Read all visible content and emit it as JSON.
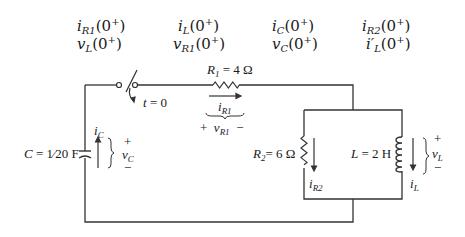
{
  "questions": [
    {
      "sym": "i",
      "sub": "R1",
      "arg": "(0",
      "sup": "+",
      "close": ")"
    },
    {
      "sym": "i",
      "sub": "L",
      "arg": "(0",
      "sup": "+",
      "close": ")"
    },
    {
      "sym": "i",
      "sub": "C",
      "arg": "(0",
      "sup": "+",
      "close": ")"
    },
    {
      "sym": "i",
      "sub": "R2",
      "arg": "(0",
      "sup": "+",
      "close": ")"
    },
    {
      "sym": "v",
      "sub": "L",
      "arg": "(0",
      "sup": "+",
      "close": ")"
    },
    {
      "sym": "v",
      "sub": "R1",
      "arg": "(0",
      "sup": "+",
      "close": ")"
    },
    {
      "sym": "v",
      "sub": "C",
      "arg": "(0",
      "sup": "+",
      "close": ")"
    },
    {
      "sym": "i′",
      "sub": "L",
      "arg": "(0",
      "sup": "+",
      "close": ")"
    }
  ],
  "components": {
    "r1": {
      "name": "R",
      "sub": "1",
      "value": " = 4 Ω"
    },
    "r2": {
      "name": "R",
      "sub": "2",
      "value": "= 6 Ω"
    },
    "l": {
      "name": "L",
      "value": " = 2 H"
    },
    "c": {
      "name": "C",
      "value": " = 1⁄20 F"
    },
    "switch": {
      "label": "t = 0"
    }
  },
  "annotations": {
    "iR1": {
      "sym": "i",
      "sub": "R1"
    },
    "vR1": {
      "plus": "+",
      "sym": "v",
      "sub": "R1",
      "minus": "−"
    },
    "iC": {
      "sym": "i",
      "sub": "C"
    },
    "vC": {
      "plus": "+",
      "sym": "v",
      "sub": "C",
      "minus": "−"
    },
    "iR2": {
      "sym": "i",
      "sub": "R2"
    },
    "iL": {
      "sym": "i",
      "sub": "L"
    },
    "vL": {
      "plus": "+",
      "sym": "v",
      "sub": "L",
      "minus": "−"
    }
  }
}
